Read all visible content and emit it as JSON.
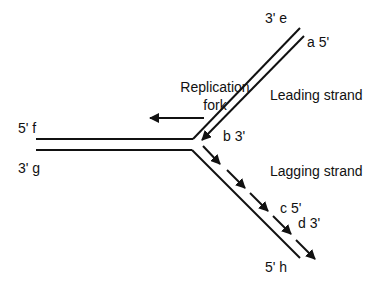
{
  "diagram": {
    "type": "DNA replication fork",
    "labels": {
      "fork": [
        "Replication",
        "fork"
      ],
      "leading": "Leading strand",
      "lagging": "Lagging strand",
      "e": "3' e",
      "a": "a 5'",
      "f": "5' f",
      "g": "3' g",
      "b": "b 3'",
      "c": "c 5'",
      "d": "d 3'",
      "h": "5' h"
    },
    "colors": {
      "line": "#111111",
      "background": "#ffffff"
    }
  }
}
